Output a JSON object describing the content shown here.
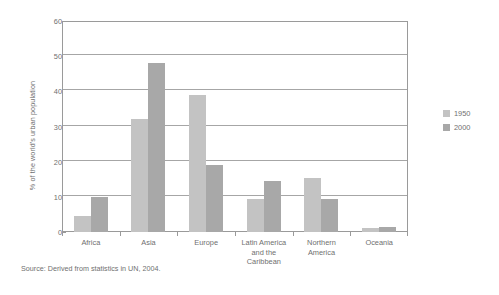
{
  "chart_data": {
    "type": "bar",
    "title": "",
    "xlabel": "",
    "ylabel": "% of the world's urban population",
    "ylim": [
      0,
      60
    ],
    "yticks": [
      0,
      10,
      20,
      30,
      40,
      50,
      60
    ],
    "grid": true,
    "legend_position": "right",
    "categories": [
      "Africa",
      "Asia",
      "Europe",
      "Latin America and the Caribbean",
      "Northern America",
      "Oceania"
    ],
    "category_lines": [
      [
        "Africa"
      ],
      [
        "Asia"
      ],
      [
        "Europe"
      ],
      [
        "Latin America",
        "and the",
        "Caribbean"
      ],
      [
        "Northern",
        "America"
      ],
      [
        "Oceania"
      ]
    ],
    "series": [
      {
        "name": "1950",
        "color": "#c3c3c3",
        "values": [
          4.5,
          32.0,
          39.0,
          9.5,
          15.5,
          1.2
        ]
      },
      {
        "name": "2000",
        "color": "#a8a8a8",
        "values": [
          10.0,
          48.0,
          19.0,
          14.5,
          9.3,
          1.3
        ]
      }
    ],
    "source": "Source: Derived from statistics in UN, 2004."
  },
  "legend": {
    "items": [
      {
        "label": "1950",
        "color": "#c3c3c3"
      },
      {
        "label": "2000",
        "color": "#a8a8a8"
      }
    ]
  },
  "axis": {
    "y_title": "% of the world's urban population",
    "y_tick_labels": [
      "60",
      "50",
      "40",
      "30",
      "20",
      "10",
      "0"
    ]
  },
  "footer": {
    "source": "Source: Derived from statistics in UN, 2004."
  },
  "colors": {
    "series_1950": "#c3c3c3",
    "series_2000": "#a8a8a8",
    "grid": "#a6a6a6",
    "frame": "#9a9a9a",
    "text": "#6f6f6f"
  }
}
